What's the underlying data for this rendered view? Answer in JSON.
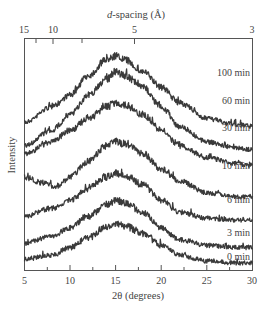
{
  "chart_data": {
    "type": "line",
    "title": "",
    "xlabel": "2θ (degrees)",
    "ylabel": "Intensity",
    "top_xlabel": "d-spacing (Å)",
    "xlim": [
      5,
      30
    ],
    "x_ticks": [
      5,
      10,
      15,
      20,
      25,
      30
    ],
    "top_ticks": [
      15,
      10,
      5,
      3
    ],
    "top_tick_positions_2theta": [
      5.89,
      8.84,
      17.74,
      29.76
    ],
    "grid": false,
    "legend": "inline labels at right end of each curve",
    "stacked_offset": true,
    "series": [
      {
        "name": "100 min",
        "x": [
          5,
          8,
          10,
          12,
          14,
          15,
          16,
          18,
          20,
          22,
          25,
          28,
          30
        ],
        "values": [
          0.58,
          0.66,
          0.72,
          0.82,
          0.9,
          0.92,
          0.9,
          0.84,
          0.76,
          0.68,
          0.6,
          0.57,
          0.56
        ]
      },
      {
        "name": "60 min",
        "x": [
          5,
          8,
          10,
          12,
          14,
          15,
          16,
          18,
          20,
          22,
          25,
          28,
          30
        ],
        "values": [
          0.46,
          0.54,
          0.62,
          0.72,
          0.8,
          0.84,
          0.82,
          0.76,
          0.66,
          0.56,
          0.48,
          0.45,
          0.44
        ]
      },
      {
        "name": "30 min",
        "x": [
          5,
          8,
          10,
          12,
          14,
          15,
          16,
          18,
          20,
          22,
          25,
          28,
          30
        ],
        "values": [
          0.42,
          0.48,
          0.54,
          0.6,
          0.66,
          0.68,
          0.67,
          0.62,
          0.54,
          0.46,
          0.4,
          0.37,
          0.36
        ]
      },
      {
        "name": "10 min",
        "x": [
          5,
          7,
          8.5,
          10,
          12,
          14,
          15,
          16,
          18,
          20,
          22,
          25,
          28,
          30
        ],
        "values": [
          0.3,
          0.27,
          0.25,
          0.3,
          0.38,
          0.46,
          0.48,
          0.47,
          0.42,
          0.34,
          0.28,
          0.22,
          0.2,
          0.2
        ]
      },
      {
        "name": "6 min",
        "x": [
          5,
          8,
          10,
          12,
          14,
          15,
          16,
          18,
          20,
          22,
          25,
          28,
          30
        ],
        "values": [
          0.1,
          0.14,
          0.18,
          0.24,
          0.3,
          0.32,
          0.31,
          0.26,
          0.18,
          0.12,
          0.09,
          0.08,
          0.08
        ]
      },
      {
        "name": "3 min",
        "x": [
          5,
          8,
          10,
          12,
          14,
          15,
          16,
          18,
          20,
          22,
          25,
          28,
          30
        ],
        "values": [
          -0.04,
          0.0,
          0.04,
          0.1,
          0.16,
          0.18,
          0.17,
          0.12,
          0.04,
          -0.02,
          -0.05,
          -0.06,
          -0.06
        ]
      },
      {
        "name": "0 min",
        "x": [
          5,
          8,
          10,
          12,
          14,
          15,
          16,
          18,
          20,
          22,
          25,
          28,
          30
        ],
        "values": [
          -0.12,
          -0.1,
          -0.06,
          -0.01,
          0.04,
          0.06,
          0.05,
          0.01,
          -0.05,
          -0.1,
          -0.13,
          -0.14,
          -0.14
        ]
      }
    ],
    "annotations": [
      "100 min",
      "60 min",
      "30 min",
      "10 min",
      "6 min",
      "3 min",
      "0 min"
    ]
  },
  "axes": {
    "bottom_title": "2θ (degrees)",
    "top_title_italic": "d",
    "top_title_rest": "-spacing (Å)",
    "left_title": "Intensity",
    "bottom_tick_labels": [
      "5",
      "10",
      "15",
      "20",
      "25",
      "30"
    ],
    "top_tick_labels": [
      "15",
      "10",
      "5",
      "3"
    ]
  },
  "curve_labels": [
    "100 min",
    "60 min",
    "30 min",
    "10 min",
    "6 min",
    "3 min",
    "0 min"
  ],
  "colors": {
    "curve": "#3a3a3a",
    "axis": "#555555",
    "text": "#444444"
  }
}
